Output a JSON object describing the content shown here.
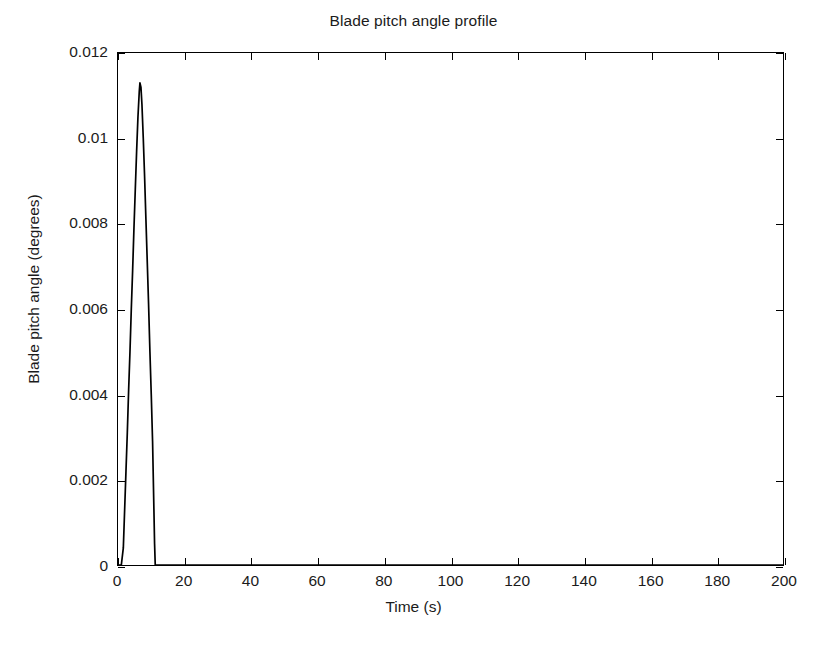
{
  "chart_data": {
    "type": "line",
    "title": "Blade pitch angle profile",
    "xlabel": "Time (s)",
    "ylabel": "Blade pitch angle (degrees)",
    "xlim": [
      0,
      200
    ],
    "ylim": [
      0,
      0.012
    ],
    "xticks": [
      0,
      20,
      40,
      60,
      80,
      100,
      120,
      140,
      160,
      180,
      200
    ],
    "xticklabels": [
      "0",
      "20",
      "40",
      "60",
      "80",
      "100",
      "120",
      "140",
      "160",
      "180",
      "200"
    ],
    "yticks": [
      0,
      0.002,
      0.004,
      0.006,
      0.008,
      0.01,
      0.012
    ],
    "yticklabels": [
      "0",
      "0.002",
      "0.004",
      "0.006",
      "0.008",
      "0.01",
      "0.012"
    ],
    "grid": false,
    "legend": null,
    "line_color": "#000000",
    "line_width": 1.6,
    "series": [
      {
        "name": "Blade pitch angle",
        "x": [
          0,
          1.0,
          1.6,
          2.0,
          2.4,
          2.8,
          3.2,
          3.6,
          4.0,
          4.4,
          4.8,
          5.2,
          5.6,
          6.0,
          6.4,
          6.6,
          6.9,
          7.2,
          7.6,
          8.0,
          8.4,
          8.8,
          9.2,
          9.6,
          10.0,
          10.4,
          10.8,
          11.0,
          11.2,
          12.0,
          20,
          40,
          60,
          80,
          100,
          120,
          140,
          160,
          180,
          200
        ],
        "y": [
          0,
          0,
          0.0004,
          0.0013,
          0.0022,
          0.0031,
          0.0041,
          0.005,
          0.006,
          0.0069,
          0.0079,
          0.0088,
          0.0097,
          0.0105,
          0.0111,
          0.0113,
          0.0112,
          0.0108,
          0.01,
          0.0091,
          0.0081,
          0.0071,
          0.0061,
          0.005,
          0.004,
          0.0029,
          0.0013,
          0.0005,
          0,
          0,
          0,
          0,
          0,
          0,
          0,
          0,
          0,
          0,
          0,
          0
        ]
      }
    ],
    "annotations": [],
    "peak": {
      "x": 6.6,
      "y": 0.0113
    }
  }
}
